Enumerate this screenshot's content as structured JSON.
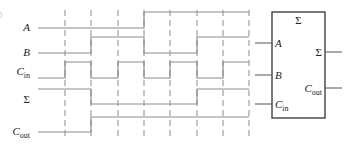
{
  "figure": {
    "type": "timing-diagram-with-full-adder",
    "colors": {
      "trace": "#8c8c8c",
      "box": "#333333",
      "text": "#222222",
      "background": "#ffffff"
    }
  },
  "timing": {
    "x_start": 38,
    "x_end": 249,
    "edges": [
      65,
      91,
      118,
      144,
      170,
      197,
      223,
      249
    ],
    "dash_top": 10,
    "dash_bottom": 138,
    "signals": [
      {
        "name": "A",
        "base": "A",
        "sub": "",
        "label_y": 31,
        "high_y": 12,
        "low_y": 28,
        "levels": [
          0,
          0,
          0,
          0,
          1,
          1,
          1,
          1
        ]
      },
      {
        "name": "B",
        "base": "B",
        "sub": "",
        "label_y": 56,
        "high_y": 37,
        "low_y": 53,
        "levels": [
          0,
          0,
          1,
          1,
          0,
          0,
          1,
          1
        ]
      },
      {
        "name": "Cin",
        "base": "C",
        "sub": "in",
        "label_y": 75,
        "high_y": 62,
        "low_y": 78,
        "levels": [
          0,
          1,
          0,
          1,
          0,
          1,
          0,
          1
        ]
      },
      {
        "name": "Sum",
        "base": "Σ",
        "sub": "",
        "label_y": 103,
        "high_y": 89,
        "low_y": 104,
        "levels": [
          1,
          1,
          0,
          0,
          0,
          0,
          1,
          1
        ]
      },
      {
        "name": "Cout",
        "base": "C",
        "sub": "out",
        "label_y": 135,
        "high_y": 117,
        "low_y": 132,
        "levels": [
          0,
          0,
          1,
          1,
          1,
          1,
          1,
          1
        ]
      }
    ]
  },
  "adder_block": {
    "title": "Σ",
    "box": {
      "x": 272,
      "y": 12,
      "w": 53,
      "h": 106
    },
    "inputs": [
      {
        "base": "A",
        "sub": "",
        "y": 43
      },
      {
        "base": "B",
        "sub": "",
        "y": 75
      },
      {
        "base": "C",
        "sub": "in",
        "y": 104
      }
    ],
    "outputs": [
      {
        "base": "Σ",
        "sub": "",
        "y": 52
      },
      {
        "base": "C",
        "sub": "out",
        "y": 88
      }
    ]
  }
}
